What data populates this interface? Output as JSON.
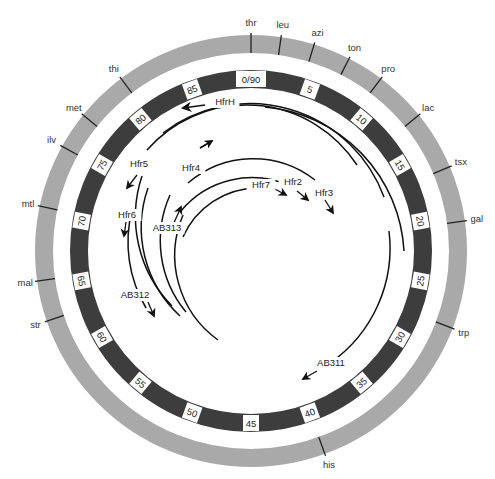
{
  "diagram": {
    "center": [
      251,
      251
    ],
    "colors": {
      "outer_ring": "#a9a9a9",
      "inner_ring": "#3d3d3d",
      "tick": "#222222",
      "arc": "#111111",
      "label_box": "#ffffff"
    },
    "outer_ring": {
      "r_outer": 216,
      "r_inner": 198
    },
    "inner_ring": {
      "r_outer": 181,
      "r_inner": 163
    },
    "total_units": 90,
    "genes": [
      {
        "name": "thr",
        "angle": 0
      },
      {
        "name": "leu",
        "angle": 8
      },
      {
        "name": "azi",
        "angle": 17
      },
      {
        "name": "ton",
        "angle": 27
      },
      {
        "name": "pro",
        "angle": 37
      },
      {
        "name": "lac",
        "angle": 51
      },
      {
        "name": "tsx",
        "angle": 67
      },
      {
        "name": "gal",
        "angle": 82
      },
      {
        "name": "trp",
        "angle": 111
      },
      {
        "name": "his",
        "angle": 160
      },
      {
        "name": "str",
        "angle": 251
      },
      {
        "name": "mal",
        "angle": 262
      },
      {
        "name": "mtl",
        "angle": 282
      },
      {
        "name": "ilv",
        "angle": 299
      },
      {
        "name": "met",
        "angle": 309
      },
      {
        "name": "thi",
        "angle": 323
      }
    ],
    "units": [
      {
        "label": "0/90",
        "angle": 0
      },
      {
        "label": "5",
        "angle": 20
      },
      {
        "label": "10",
        "angle": 40
      },
      {
        "label": "15",
        "angle": 60
      },
      {
        "label": "20",
        "angle": 80
      },
      {
        "label": "25",
        "angle": 100
      },
      {
        "label": "30",
        "angle": 120
      },
      {
        "label": "35",
        "angle": 140
      },
      {
        "label": "40",
        "angle": 160
      },
      {
        "label": "45",
        "angle": 180
      },
      {
        "label": "50",
        "angle": 200
      },
      {
        "label": "55",
        "angle": 220
      },
      {
        "label": "60",
        "angle": 240
      },
      {
        "label": "65",
        "angle": 260
      },
      {
        "label": "70",
        "angle": 280
      },
      {
        "label": "75",
        "angle": 300
      },
      {
        "label": "80",
        "angle": 320
      },
      {
        "label": "85",
        "angle": 340
      }
    ],
    "strains": [
      {
        "name": "HfrH",
        "label_xy": [
          225,
          105
        ],
        "direction": "counterclockwise"
      },
      {
        "name": "Hfr5",
        "label_xy": [
          139,
          167
        ],
        "direction": "counterclockwise"
      },
      {
        "name": "Hfr4",
        "label_xy": [
          191,
          171
        ],
        "direction": "clockwise"
      },
      {
        "name": "Hfr6",
        "label_xy": [
          127,
          218
        ],
        "direction": "counterclockwise"
      },
      {
        "name": "AB313",
        "label_xy": [
          167,
          231
        ],
        "direction": "clockwise"
      },
      {
        "name": "Hfr7",
        "label_xy": [
          261,
          188
        ],
        "direction": "clockwise"
      },
      {
        "name": "Hfr2",
        "label_xy": [
          293,
          185
        ],
        "direction": "clockwise"
      },
      {
        "name": "Hfr3",
        "label_xy": [
          324,
          196
        ],
        "direction": "clockwise"
      },
      {
        "name": "AB312",
        "label_xy": [
          135,
          298
        ],
        "direction": "counterclockwise"
      },
      {
        "name": "AB311",
        "label_xy": [
          331,
          366
        ],
        "direction": "counterclockwise"
      }
    ]
  }
}
